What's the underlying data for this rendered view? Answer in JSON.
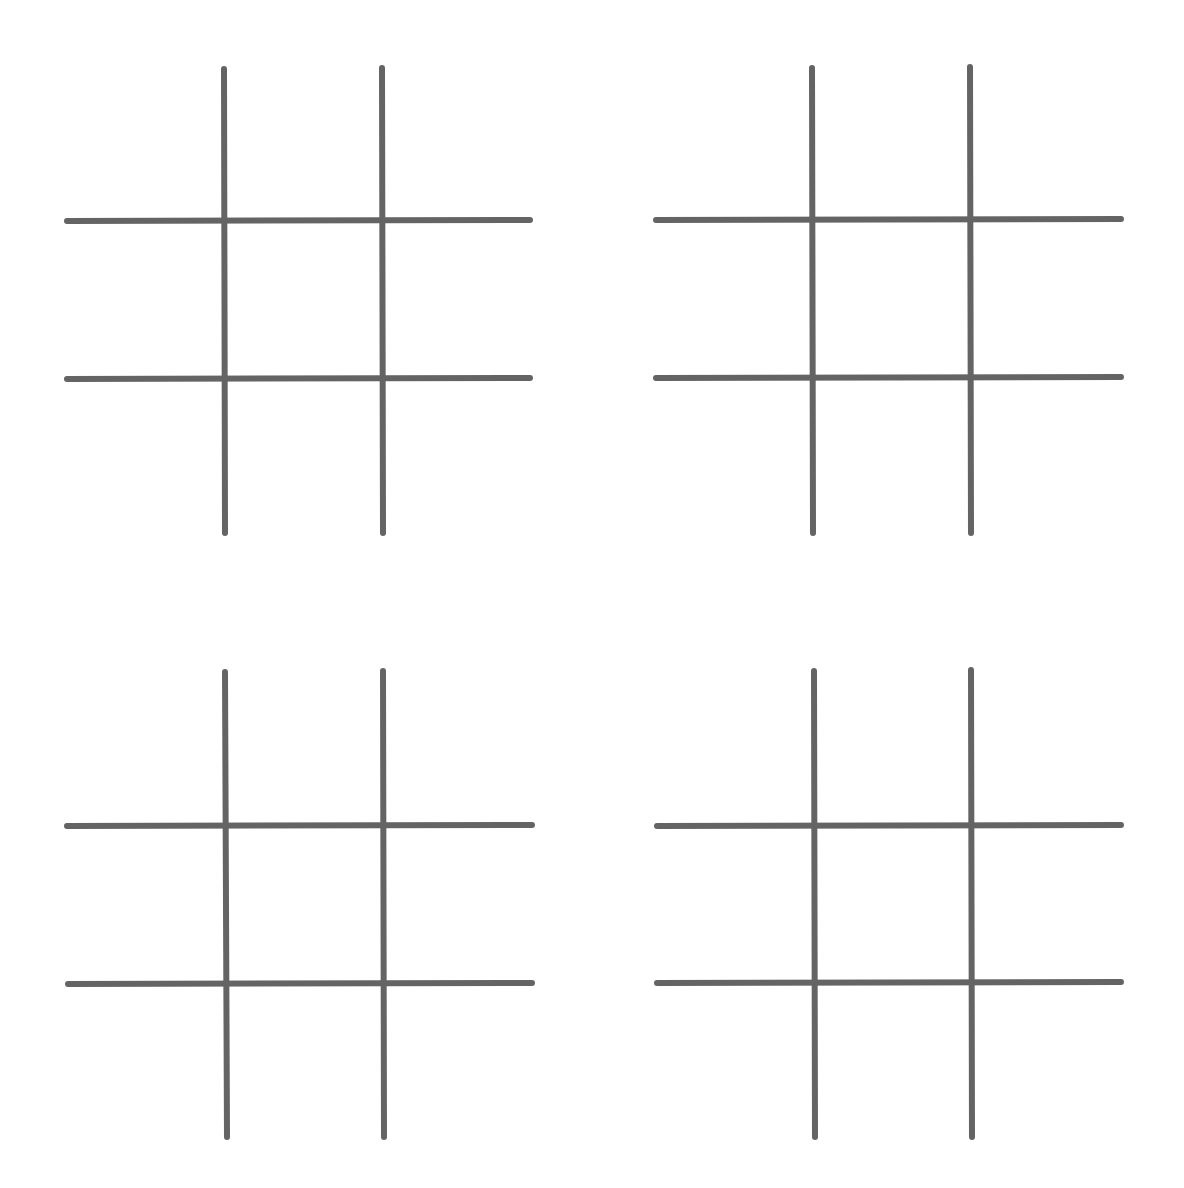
{
  "colors": {
    "background": "#ffffff",
    "grid_line": "#646464"
  },
  "line_width": 6,
  "boards": [
    {
      "id": "board-top-left",
      "v_lines": [
        {
          "x1": 224,
          "y1": 69,
          "x2": 225,
          "y2": 533
        },
        {
          "x1": 382,
          "y1": 68,
          "x2": 383,
          "y2": 533
        }
      ],
      "h_lines": [
        {
          "x1": 67,
          "y1": 221,
          "x2": 530,
          "y2": 220
        },
        {
          "x1": 67,
          "y1": 379,
          "x2": 530,
          "y2": 378
        }
      ],
      "cells": [
        "",
        "",
        "",
        "",
        "",
        "",
        "",
        "",
        ""
      ]
    },
    {
      "id": "board-top-right",
      "v_lines": [
        {
          "x1": 812,
          "y1": 68,
          "x2": 813,
          "y2": 533
        },
        {
          "x1": 970,
          "y1": 67,
          "x2": 971,
          "y2": 533
        }
      ],
      "h_lines": [
        {
          "x1": 656,
          "y1": 220,
          "x2": 1121,
          "y2": 219
        },
        {
          "x1": 656,
          "y1": 378,
          "x2": 1121,
          "y2": 377
        }
      ],
      "cells": [
        "",
        "",
        "",
        "",
        "",
        "",
        "",
        "",
        ""
      ]
    },
    {
      "id": "board-bottom-left",
      "v_lines": [
        {
          "x1": 225,
          "y1": 672,
          "x2": 227,
          "y2": 1137
        },
        {
          "x1": 383,
          "y1": 671,
          "x2": 384,
          "y2": 1137
        }
      ],
      "h_lines": [
        {
          "x1": 67,
          "y1": 826,
          "x2": 532,
          "y2": 825
        },
        {
          "x1": 68,
          "y1": 984,
          "x2": 532,
          "y2": 983
        }
      ],
      "cells": [
        "",
        "",
        "",
        "",
        "",
        "",
        "",
        "",
        ""
      ]
    },
    {
      "id": "board-bottom-right",
      "v_lines": [
        {
          "x1": 814,
          "y1": 671,
          "x2": 815,
          "y2": 1137
        },
        {
          "x1": 971,
          "y1": 670,
          "x2": 972,
          "y2": 1137
        }
      ],
      "h_lines": [
        {
          "x1": 657,
          "y1": 826,
          "x2": 1121,
          "y2": 825
        },
        {
          "x1": 657,
          "y1": 983,
          "x2": 1121,
          "y2": 982
        }
      ],
      "cells": [
        "",
        "",
        "",
        "",
        "",
        "",
        "",
        "",
        ""
      ]
    }
  ]
}
